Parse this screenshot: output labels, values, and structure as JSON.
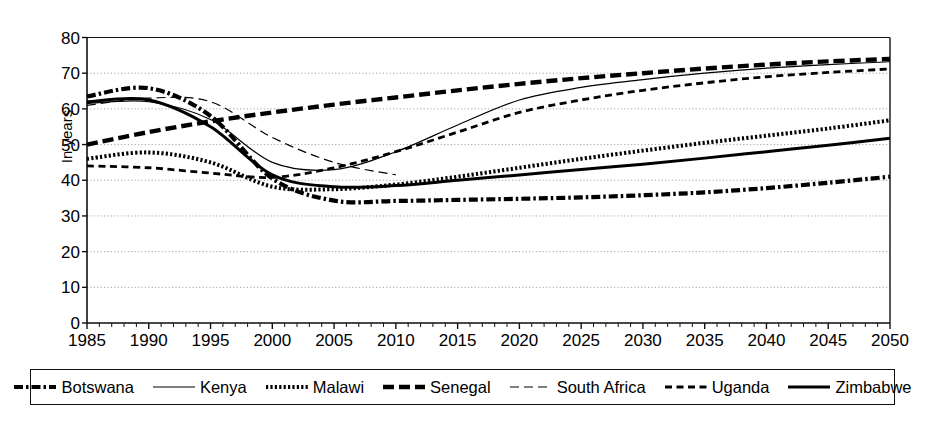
{
  "chart_data": {
    "type": "line",
    "title": "",
    "xlabel": "",
    "ylabel": "In years",
    "xlim": [
      1985,
      2050
    ],
    "ylim": [
      0,
      80
    ],
    "ytick_values": [
      0,
      10,
      20,
      30,
      40,
      50,
      60,
      70,
      80
    ],
    "xtick_values": [
      1985,
      1990,
      1995,
      2000,
      2005,
      2010,
      2015,
      2020,
      2025,
      2030,
      2035,
      2040,
      2045,
      2050
    ],
    "grid": true,
    "grid_axis": "y",
    "legend_position": "bottom",
    "x": [
      1985,
      1990,
      1995,
      2000,
      2005,
      2010,
      2015,
      2020,
      2025,
      2030,
      2035,
      2040,
      2045,
      2050
    ],
    "series": [
      {
        "name": "Botswana",
        "style": "dash-dot-thick",
        "values": [
          63.5,
          65.8,
          58.0,
          40.5,
          34.3,
          34.2,
          34.5,
          34.8,
          35.2,
          35.8,
          36.6,
          37.8,
          39.3,
          41.0
        ]
      },
      {
        "name": "Kenya",
        "style": "thin-solid",
        "values": [
          61.5,
          62.0,
          57.0,
          45.0,
          43.0,
          48.0,
          55.5,
          62.5,
          66.0,
          68.2,
          70.0,
          71.4,
          72.4,
          73.2
        ]
      },
      {
        "name": "Malawi",
        "style": "dotted-thick",
        "values": [
          46.0,
          47.8,
          45.0,
          38.2,
          37.5,
          38.8,
          41.0,
          43.5,
          46.0,
          48.3,
          50.5,
          52.5,
          54.5,
          56.8
        ]
      },
      {
        "name": "Senegal",
        "style": "dashed-thick",
        "values": [
          50.0,
          53.5,
          56.5,
          59.0,
          61.2,
          63.2,
          65.2,
          67.0,
          68.6,
          70.0,
          71.3,
          72.4,
          73.3,
          74.0
        ]
      },
      {
        "name": "South Africa",
        "style": "thin-longdash",
        "values": [
          61.0,
          63.0,
          62.0,
          52.0,
          45.0,
          41.5,
          null,
          null,
          null,
          null,
          null,
          null,
          null,
          null
        ]
      },
      {
        "name": "Uganda",
        "style": "dashed-medium",
        "values": [
          44.0,
          43.5,
          42.0,
          40.8,
          43.5,
          48.0,
          53.5,
          59.0,
          62.5,
          65.2,
          67.3,
          69.0,
          70.2,
          71.2
        ]
      },
      {
        "name": "Zimbabwe",
        "style": "thick-solid",
        "values": [
          62.0,
          62.5,
          55.0,
          41.5,
          38.2,
          38.5,
          40.0,
          41.5,
          43.0,
          44.5,
          46.2,
          48.0,
          49.8,
          51.8
        ]
      }
    ]
  },
  "axis": {
    "ylabel": "In years",
    "yticks": [
      "0",
      "10",
      "20",
      "30",
      "40",
      "50",
      "60",
      "70",
      "80"
    ],
    "xticks": [
      "1985",
      "1990",
      "1995",
      "2000",
      "2005",
      "2010",
      "2015",
      "2020",
      "2025",
      "2030",
      "2035",
      "2040",
      "2045",
      "2050"
    ]
  },
  "legend": {
    "items": [
      {
        "label": "Botswana",
        "swatch": "dash-dot-thick-swatch"
      },
      {
        "label": "Kenya",
        "swatch": "thin-solid-swatch"
      },
      {
        "label": "Malawi",
        "swatch": "dotted-thick-swatch"
      },
      {
        "label": "Senegal",
        "swatch": "dashed-thick-swatch"
      },
      {
        "label": "South Africa",
        "swatch": "thin-longdash-swatch"
      },
      {
        "label": "Uganda",
        "swatch": "dashed-medium-swatch"
      },
      {
        "label": "Zimbabwe",
        "swatch": "thick-solid-swatch"
      }
    ]
  },
  "colors": {
    "line": "#000000",
    "grid": "#999999",
    "axis": "#333333",
    "background": "#ffffff"
  }
}
